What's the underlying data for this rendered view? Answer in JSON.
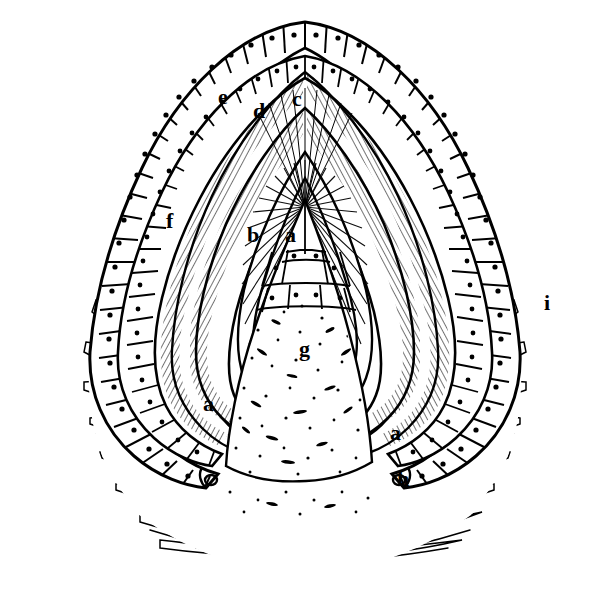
{
  "figure": {
    "background_color": "#ffffff",
    "ink_color": "#000000",
    "width": 609,
    "height": 615
  },
  "labels": [
    {
      "id": "label-e",
      "text": "e",
      "x": 218,
      "y": 86,
      "note": "outer enamel epithelium"
    },
    {
      "id": "label-d",
      "text": "d",
      "x": 253,
      "y": 100,
      "note": "stellate reticulum layer"
    },
    {
      "id": "label-c",
      "text": "c",
      "x": 292,
      "y": 88,
      "note": "inner enamel epithelium apex"
    },
    {
      "id": "label-f",
      "text": "f",
      "x": 166,
      "y": 210,
      "note": "outer epithelial sheet, left limb"
    },
    {
      "id": "label-b",
      "text": "b",
      "x": 247,
      "y": 224,
      "note": "stratum intermedium"
    },
    {
      "id": "label-a1",
      "text": "a",
      "x": 285,
      "y": 224,
      "note": "dental papilla apex"
    },
    {
      "id": "label-g",
      "text": "g",
      "x": 299,
      "y": 338,
      "note": "dental papilla / mesenchyme core"
    },
    {
      "id": "label-a2",
      "text": "a",
      "x": 203,
      "y": 393,
      "note": "papilla margin, left limb"
    },
    {
      "id": "label-a3",
      "text": "a",
      "x": 390,
      "y": 422,
      "note": "papilla margin, right limb"
    },
    {
      "id": "label-h",
      "text": "h",
      "x": 397,
      "y": 468,
      "note": "cervical loop"
    },
    {
      "id": "label-i",
      "text": "i",
      "x": 544,
      "y": 292,
      "note": "surrounding fibrous connective tissue"
    }
  ],
  "regions": [
    {
      "id": "outer-epithelium",
      "name": "outer epithelial cell row"
    },
    {
      "id": "middle-epithelium",
      "name": "middle epithelial cell row"
    },
    {
      "id": "inner-epithelium",
      "name": "inner enamel epithelium (columnar, striated)"
    },
    {
      "id": "papilla-core",
      "name": "dental papilla stippled core"
    },
    {
      "id": "stroma-left",
      "name": "fibrous stroma, left"
    },
    {
      "id": "stroma-right",
      "name": "fibrous stroma, right"
    },
    {
      "id": "stroma-bottom",
      "name": "fibrous stroma, bottom"
    }
  ]
}
